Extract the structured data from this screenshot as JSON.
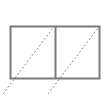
{
  "figure": {
    "background_color": "#ffffff",
    "canvas": {
      "width": 108,
      "height": 99
    }
  },
  "geometry": {
    "outline": {
      "name": "rectangle-outline",
      "x": 10.5,
      "y": 26.5,
      "width": 89,
      "height": 52,
      "stroke_color": "#7a7a7a",
      "stroke_width": 2,
      "fill": "none"
    },
    "divider": {
      "name": "vertical-divider",
      "x": 55.5,
      "y1": 26.5,
      "y2": 78.5,
      "stroke_color": "#7a7a7a",
      "stroke_width": 2
    },
    "diagonals": [
      {
        "name": "left-cell-diagonal",
        "x1": 3,
        "y1": 94,
        "x2": 53,
        "y2": 28,
        "stroke_color": "#8a8a8a",
        "stroke_width": 1,
        "dash_pattern": "2 2"
      },
      {
        "name": "right-cell-diagonal",
        "x1": 48,
        "y1": 94,
        "x2": 98,
        "y2": 28,
        "stroke_color": "#8a8a8a",
        "stroke_width": 1,
        "dash_pattern": "2 2"
      }
    ]
  },
  "colors": {
    "outline_gray": "#7a7a7a",
    "dash_gray": "#8a8a8a",
    "background": "#ffffff"
  }
}
